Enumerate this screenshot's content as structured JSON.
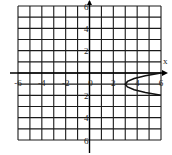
{
  "chart_data": {
    "type": "line",
    "title": "",
    "xlabel": "x",
    "ylabel": "",
    "xlim": [
      -6,
      6
    ],
    "ylim": [
      -6,
      6
    ],
    "grid": true,
    "grid_step": 1,
    "x_ticks": [
      {
        "value": -6,
        "label": "-6"
      },
      {
        "value": -4,
        "label": "-4"
      },
      {
        "value": -2,
        "label": "-2"
      },
      {
        "value": 0,
        "label": "0"
      },
      {
        "value": 2,
        "label": "2"
      },
      {
        "value": 4,
        "label": "4"
      },
      {
        "value": 6,
        "label": "6"
      }
    ],
    "y_ticks": [
      {
        "value": 6,
        "label": "6"
      },
      {
        "value": 4,
        "label": "4"
      },
      {
        "value": 2,
        "label": "2"
      },
      {
        "value": -2,
        "label": "2"
      },
      {
        "value": -4,
        "label": "4"
      },
      {
        "value": -6,
        "label": "6"
      }
    ],
    "series": [
      {
        "name": "sideways parabola",
        "equation": "x = 3(y+1)^2 + 3",
        "vertex": [
          3,
          -1
        ],
        "points": [
          [
            6,
            0
          ],
          [
            4.6875,
            -0.25
          ],
          [
            3.75,
            -0.5
          ],
          [
            3.1875,
            -0.75
          ],
          [
            3,
            -1
          ],
          [
            3.1875,
            -1.25
          ],
          [
            3.75,
            -1.5
          ],
          [
            4.6875,
            -1.75
          ],
          [
            6,
            -2
          ]
        ],
        "color": "#111111"
      }
    ],
    "legend": null
  },
  "colors": {
    "grid": "#1a1a1a",
    "curve": "#111111",
    "background": "#ffffff"
  }
}
